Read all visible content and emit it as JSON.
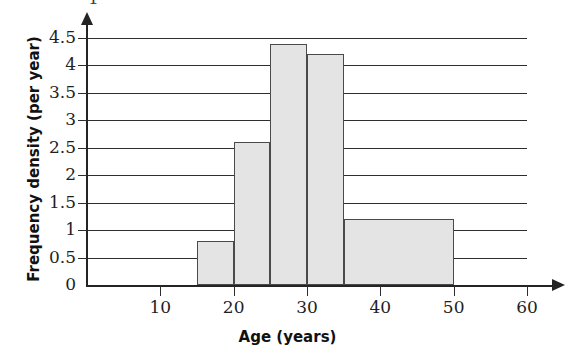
{
  "chart_data": {
    "type": "bar",
    "title": "",
    "subtitle": "",
    "xlabel": "Age (years)",
    "ylabel": "Frequency density (per year)",
    "xlim": [
      0,
      60
    ],
    "ylim": [
      0,
      4.5
    ],
    "grid": true,
    "legend": null,
    "orientation": "vertical",
    "style": "histogram",
    "bar_fill_color": "#e4e4e4",
    "bar_edge_color": "#4a4a4a",
    "axis_color": "#242424",
    "gridline_color": "#2e2e2e",
    "x_ticks": [
      10,
      20,
      30,
      40,
      50,
      60
    ],
    "x_tick_labels": [
      "10",
      "20",
      "30",
      "40",
      "50",
      "60"
    ],
    "y_ticks": [
      0,
      0.5,
      1,
      1.5,
      2,
      2.5,
      3,
      3.5,
      4,
      4.5
    ],
    "y_tick_labels": [
      "0",
      "0.5",
      "1",
      "1.5",
      "2",
      "2.5",
      "3",
      "3.5",
      "4",
      "4.5"
    ],
    "bins": [
      {
        "label": "15-20",
        "x_start": 15,
        "x_end": 20,
        "value": 0.8,
        "frequency": 4
      },
      {
        "label": "20-25",
        "x_start": 20,
        "x_end": 25,
        "value": 2.6,
        "frequency": 13
      },
      {
        "label": "25-30",
        "x_start": 25,
        "x_end": 30,
        "value": 4.4,
        "frequency": 22
      },
      {
        "label": "30-35",
        "x_start": 30,
        "x_end": 35,
        "value": 4.2,
        "frequency": 21
      },
      {
        "label": "35-50",
        "x_start": 35,
        "x_end": 50,
        "value": 1.2,
        "frequency": 18
      }
    ],
    "categories": [
      "15-20",
      "20-25",
      "25-30",
      "30-35",
      "35-50"
    ],
    "values": [
      0.8,
      2.6,
      4.4,
      4.2,
      1.2
    ]
  },
  "page": {
    "cut_off_glyph": "1"
  }
}
